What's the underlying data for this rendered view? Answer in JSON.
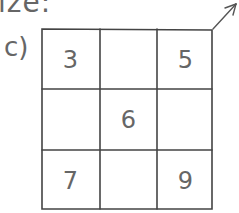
{
  "header": {
    "partial_text": "ize:"
  },
  "problem": {
    "label": "c)",
    "grid": {
      "rows": 3,
      "cols": 3,
      "cells": [
        [
          "3",
          "",
          "5"
        ],
        [
          "",
          "6",
          ""
        ],
        [
          "7",
          "",
          "9"
        ]
      ]
    },
    "arrow": "arrow-up-right-icon"
  }
}
